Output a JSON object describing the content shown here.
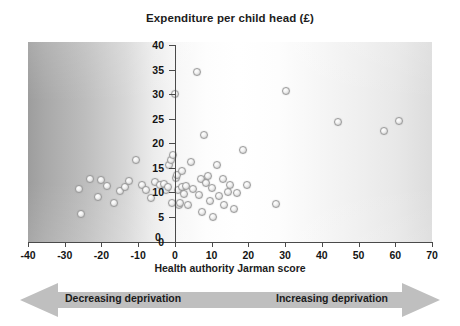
{
  "chart_data": {
    "type": "scatter",
    "title": "Expenditure per child head (£)",
    "xlabel": "Health authority Jarman score",
    "ylabel": "Expenditure per child head (£)",
    "xlim": [
      -40,
      70
    ],
    "ylim": [
      0,
      40
    ],
    "xticks": [
      -40,
      -30,
      -20,
      -10,
      0,
      10,
      20,
      30,
      40,
      50,
      60,
      70
    ],
    "yticks": [
      0,
      5,
      10,
      15,
      20,
      25,
      30,
      35,
      40
    ],
    "grid": false,
    "legend": null,
    "annotations": [
      {
        "text": "Decreasing deprivation",
        "position": "bottom-left",
        "arrow": "left"
      },
      {
        "text": "Increasing deprivation",
        "position": "bottom-right",
        "arrow": "right"
      }
    ],
    "marker": {
      "shape": "circle",
      "face": "#eeeeee",
      "edge": "#9a9a9a",
      "size": 8
    },
    "background": {
      "type": "horizontal-gradient",
      "left": "#9d9d9d",
      "center": "#ffffff",
      "right": "#dcdcdc"
    },
    "points": [
      {
        "x": -26.0,
        "y": 10.6
      },
      {
        "x": -25.5,
        "y": 5.5
      },
      {
        "x": -23.0,
        "y": 12.7
      },
      {
        "x": -21.0,
        "y": 9.1
      },
      {
        "x": -20.0,
        "y": 12.6
      },
      {
        "x": -18.5,
        "y": 11.3
      },
      {
        "x": -16.5,
        "y": 7.8
      },
      {
        "x": -15.0,
        "y": 10.2
      },
      {
        "x": -13.5,
        "y": 11.1
      },
      {
        "x": -12.5,
        "y": 12.4
      },
      {
        "x": -10.5,
        "y": 16.6
      },
      {
        "x": -9.0,
        "y": 11.4
      },
      {
        "x": -8.0,
        "y": 10.4
      },
      {
        "x": -6.5,
        "y": 8.8
      },
      {
        "x": -5.5,
        "y": 12.2
      },
      {
        "x": -4.0,
        "y": 11.5
      },
      {
        "x": -3.0,
        "y": 11.8
      },
      {
        "x": -2.5,
        "y": 10.4
      },
      {
        "x": -2.0,
        "y": 11.0
      },
      {
        "x": -1.5,
        "y": 15.5
      },
      {
        "x": -1.0,
        "y": 16.6
      },
      {
        "x": -0.8,
        "y": 7.8
      },
      {
        "x": -0.5,
        "y": 17.6
      },
      {
        "x": 0.0,
        "y": 30.1
      },
      {
        "x": 0.4,
        "y": 12.9
      },
      {
        "x": 0.6,
        "y": 13.6
      },
      {
        "x": 0.8,
        "y": 10.4
      },
      {
        "x": 1.0,
        "y": 7.5
      },
      {
        "x": 1.4,
        "y": 7.8
      },
      {
        "x": 1.8,
        "y": 11.0
      },
      {
        "x": 2.0,
        "y": 14.4
      },
      {
        "x": 2.4,
        "y": 9.6
      },
      {
        "x": 3.0,
        "y": 11.3
      },
      {
        "x": 3.6,
        "y": 7.4
      },
      {
        "x": 4.5,
        "y": 16.2
      },
      {
        "x": 5.0,
        "y": 10.6
      },
      {
        "x": 6.0,
        "y": 34.6
      },
      {
        "x": 6.5,
        "y": 9.5
      },
      {
        "x": 7.0,
        "y": 12.8
      },
      {
        "x": 7.5,
        "y": 6.0
      },
      {
        "x": 8.0,
        "y": 21.6
      },
      {
        "x": 8.5,
        "y": 11.9
      },
      {
        "x": 9.0,
        "y": 13.4
      },
      {
        "x": 9.5,
        "y": 8.2
      },
      {
        "x": 10.0,
        "y": 10.9
      },
      {
        "x": 10.5,
        "y": 4.9
      },
      {
        "x": 11.5,
        "y": 15.5
      },
      {
        "x": 12.0,
        "y": 9.3
      },
      {
        "x": 13.0,
        "y": 12.8
      },
      {
        "x": 13.5,
        "y": 7.4
      },
      {
        "x": 14.5,
        "y": 10.1
      },
      {
        "x": 15.0,
        "y": 11.5
      },
      {
        "x": 16.0,
        "y": 6.6
      },
      {
        "x": 17.0,
        "y": 9.8
      },
      {
        "x": 18.5,
        "y": 18.6
      },
      {
        "x": 19.5,
        "y": 11.4
      },
      {
        "x": 27.6,
        "y": 7.6
      },
      {
        "x": 30.3,
        "y": 30.7
      },
      {
        "x": 44.5,
        "y": 24.3
      },
      {
        "x": 57.0,
        "y": 22.4
      },
      {
        "x": 61.0,
        "y": 24.6
      }
    ]
  },
  "chart": {
    "title": "Expenditure per child head (£)",
    "axis_caption": "Health authority Jarman score",
    "y_tick_labels": [
      "40",
      "35",
      "30",
      "25",
      "20",
      "15",
      "10",
      "5",
      "0"
    ],
    "x_tick_labels": [
      "-40",
      "-30",
      "-20",
      "-10",
      "0",
      "10",
      "20",
      "30",
      "40",
      "50",
      "60",
      "70"
    ],
    "zero_marker_label": "0",
    "arrows": {
      "left_label": "Decreasing deprivation",
      "right_label": "Increasing deprivation",
      "band_color": "#bdbdbd"
    }
  }
}
